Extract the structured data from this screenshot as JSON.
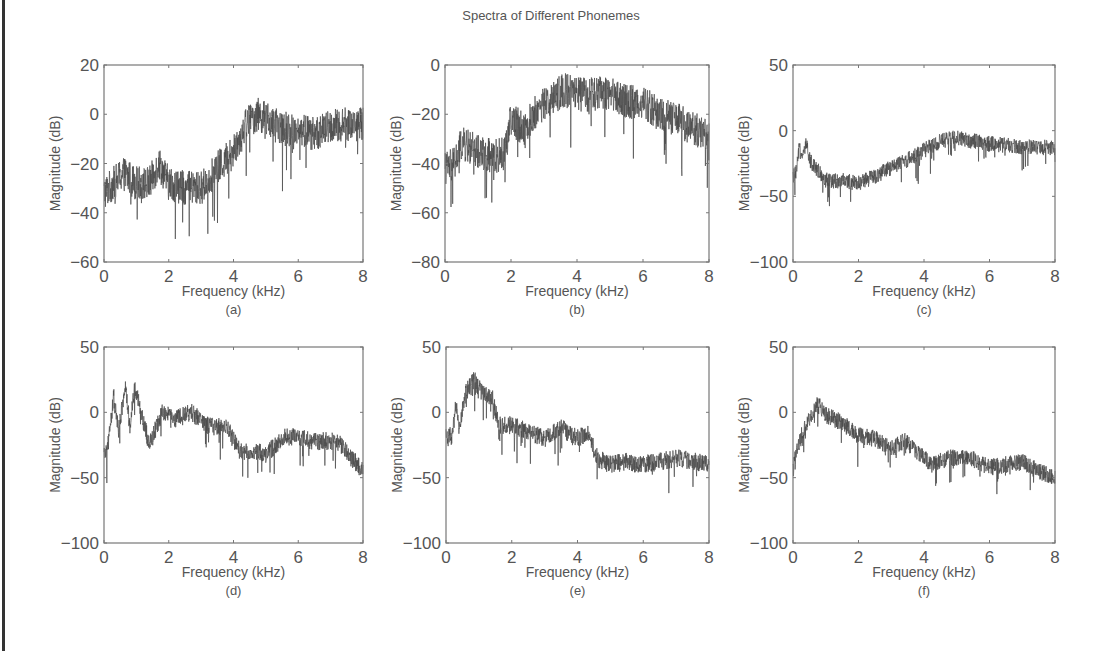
{
  "figure": {
    "title": "Spectra of Different Phonemes"
  },
  "chart_data": [
    {
      "type": "line",
      "panel": "(a)",
      "title": "",
      "xlabel": "Frequency (kHz)",
      "ylabel": "Magnitude (dB)",
      "xlim": [
        0,
        8
      ],
      "ylim": [
        -60,
        20
      ],
      "xticks": [
        0,
        2,
        4,
        6,
        8
      ],
      "yticks": [
        20,
        0,
        -20,
        -40,
        -60
      ],
      "grid": false,
      "envelope": {
        "x": [
          0,
          0.3,
          0.6,
          1.0,
          1.4,
          1.7,
          2.0,
          2.5,
          3.0,
          3.5,
          4.0,
          4.4,
          4.8,
          5.2,
          5.6,
          6.0,
          6.5,
          7.0,
          7.5,
          8.0
        ],
        "y": [
          -32,
          -28,
          -24,
          -28,
          -28,
          -20,
          -28,
          -30,
          -30,
          -22,
          -15,
          -3,
          0,
          -4,
          -6,
          -6,
          -8,
          -5,
          -4,
          -4
        ]
      },
      "noise": 14
    },
    {
      "type": "line",
      "panel": "(b)",
      "title": "",
      "xlabel": "Frequency (kHz)",
      "ylabel": "Magnitude (dB)",
      "xlim": [
        0,
        8
      ],
      "ylim": [
        -80,
        0
      ],
      "xticks": [
        0,
        2,
        4,
        6,
        8
      ],
      "yticks": [
        0,
        -20,
        -40,
        -60,
        -80
      ],
      "grid": false,
      "envelope": {
        "x": [
          0,
          0.3,
          0.5,
          1.0,
          1.5,
          1.8,
          2.0,
          2.4,
          2.8,
          3.2,
          3.6,
          4.0,
          4.5,
          5.0,
          5.5,
          6.0,
          6.5,
          7.0,
          7.5,
          8.0
        ],
        "y": [
          -42,
          -40,
          -32,
          -35,
          -37,
          -36,
          -22,
          -26,
          -18,
          -14,
          -10,
          -12,
          -12,
          -11,
          -15,
          -15,
          -20,
          -22,
          -26,
          -28
        ]
      },
      "noise": 14
    },
    {
      "type": "line",
      "panel": "(c)",
      "title": "",
      "xlabel": "Frequency (kHz)",
      "ylabel": "Magnitude (dB)",
      "xlim": [
        0,
        8
      ],
      "ylim": [
        -100,
        50
      ],
      "xticks": [
        0,
        2,
        4,
        6,
        8
      ],
      "yticks": [
        50,
        0,
        -50,
        -100
      ],
      "grid": false,
      "envelope": {
        "x": [
          0,
          0.1,
          0.2,
          0.3,
          0.4,
          0.5,
          0.7,
          1.0,
          1.5,
          2.0,
          2.5,
          3.0,
          3.5,
          4.0,
          4.5,
          5.0,
          5.5,
          6.0,
          7.0,
          8.0
        ],
        "y": [
          -35,
          -32,
          -12,
          -20,
          -10,
          -22,
          -28,
          -38,
          -38,
          -40,
          -35,
          -28,
          -22,
          -15,
          -8,
          -5,
          -8,
          -10,
          -12,
          -13
        ]
      },
      "noise": 12
    },
    {
      "type": "line",
      "panel": "(d)",
      "title": "",
      "xlabel": "Frequency (kHz)",
      "ylabel": "Magnitude (dB)",
      "xlim": [
        0,
        8
      ],
      "ylim": [
        -100,
        50
      ],
      "xticks": [
        0,
        2,
        4,
        6,
        8
      ],
      "yticks": [
        50,
        0,
        -50,
        -100
      ],
      "grid": false,
      "envelope": {
        "x": [
          0,
          0.15,
          0.3,
          0.45,
          0.65,
          0.8,
          0.95,
          1.2,
          1.4,
          1.8,
          2.2,
          2.7,
          3.2,
          3.8,
          4.2,
          4.6,
          5.0,
          5.6,
          6.5,
          7.2,
          8.0
        ],
        "y": [
          -35,
          -20,
          12,
          -15,
          20,
          -10,
          18,
          -5,
          -25,
          0,
          -5,
          0,
          -10,
          -12,
          -30,
          -30,
          -32,
          -18,
          -22,
          -22,
          -45
        ]
      },
      "noise": 14
    },
    {
      "type": "line",
      "panel": "(e)",
      "title": "",
      "xlabel": "Frequency (kHz)",
      "ylabel": "Magnitude (dB)",
      "xlim": [
        0,
        8
      ],
      "ylim": [
        -100,
        50
      ],
      "xticks": [
        0,
        2,
        4,
        6,
        8
      ],
      "yticks": [
        50,
        0,
        -50,
        -100
      ],
      "grid": false,
      "envelope": {
        "x": [
          0,
          0.2,
          0.3,
          0.4,
          0.6,
          0.85,
          1.1,
          1.4,
          1.6,
          2.0,
          2.5,
          3.0,
          3.5,
          4.0,
          4.3,
          4.6,
          5.0,
          5.5,
          6.0,
          7.0,
          8.0
        ],
        "y": [
          -18,
          -18,
          5,
          -12,
          15,
          25,
          15,
          12,
          -10,
          -10,
          -15,
          -20,
          -12,
          -20,
          -15,
          -35,
          -40,
          -38,
          -40,
          -35,
          -40
        ]
      },
      "noise": 14
    },
    {
      "type": "line",
      "panel": "(f)",
      "title": "",
      "xlabel": "Frequency (kHz)",
      "ylabel": "Magnitude (dB)",
      "xlim": [
        0,
        8
      ],
      "ylim": [
        -100,
        50
      ],
      "xticks": [
        0,
        2,
        4,
        6,
        8
      ],
      "yticks": [
        50,
        0,
        -50,
        -100
      ],
      "grid": false,
      "envelope": {
        "x": [
          0,
          0.1,
          0.3,
          0.5,
          0.7,
          0.8,
          1.0,
          1.5,
          2.0,
          2.5,
          3.0,
          3.4,
          3.8,
          4.2,
          4.8,
          5.4,
          6.0,
          6.5,
          7.0,
          7.5,
          8.0
        ],
        "y": [
          -45,
          -30,
          -15,
          -5,
          5,
          5,
          -2,
          -8,
          -18,
          -20,
          -28,
          -22,
          -30,
          -40,
          -35,
          -35,
          -42,
          -40,
          -38,
          -45,
          -50
        ]
      },
      "noise": 13
    }
  ]
}
